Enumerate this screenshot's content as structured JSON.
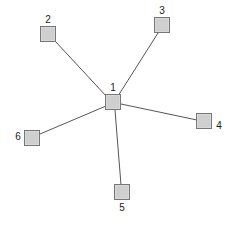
{
  "diagram": {
    "type": "node-link-graph",
    "canvas": {
      "width": 230,
      "height": 225,
      "background": "#ffffff"
    },
    "style": {
      "node_fill": "#cfcfcf",
      "node_stroke": "#777777",
      "edge_color": "#555555",
      "edge_width": 1,
      "label_color": "#1a1a1a",
      "node_size": 16
    },
    "nodes": [
      {
        "id": "1",
        "label": "1",
        "cx": 113,
        "cy": 102,
        "label_x": 113,
        "label_y": 88,
        "role": "hub"
      },
      {
        "id": "2",
        "label": "2",
        "cx": 48,
        "cy": 34,
        "label_x": 48,
        "label_y": 20,
        "role": "leaf"
      },
      {
        "id": "3",
        "label": "3",
        "cx": 162,
        "cy": 25,
        "label_x": 162,
        "label_y": 11,
        "role": "leaf"
      },
      {
        "id": "4",
        "label": "4",
        "cx": 204,
        "cy": 121,
        "label_x": 219,
        "label_y": 126,
        "role": "leaf"
      },
      {
        "id": "5",
        "label": "5",
        "cx": 122,
        "cy": 192,
        "label_x": 122,
        "label_y": 208,
        "role": "leaf"
      },
      {
        "id": "6",
        "label": "6",
        "cx": 32,
        "cy": 138,
        "label_x": 18,
        "label_y": 137,
        "role": "leaf"
      }
    ],
    "edges": [
      {
        "from": "1",
        "to": "2",
        "x1": 107,
        "y1": 97,
        "x2": 55,
        "y2": 41
      },
      {
        "from": "1",
        "to": "3",
        "x1": 118,
        "y1": 96,
        "x2": 158,
        "y2": 33
      },
      {
        "from": "1",
        "to": "4",
        "x1": 121,
        "y1": 104,
        "x2": 197,
        "y2": 120
      },
      {
        "from": "1",
        "to": "5",
        "x1": 115,
        "y1": 110,
        "x2": 121,
        "y2": 185
      },
      {
        "from": "1",
        "to": "6",
        "x1": 106,
        "y1": 106,
        "x2": 40,
        "y2": 134
      }
    ]
  }
}
